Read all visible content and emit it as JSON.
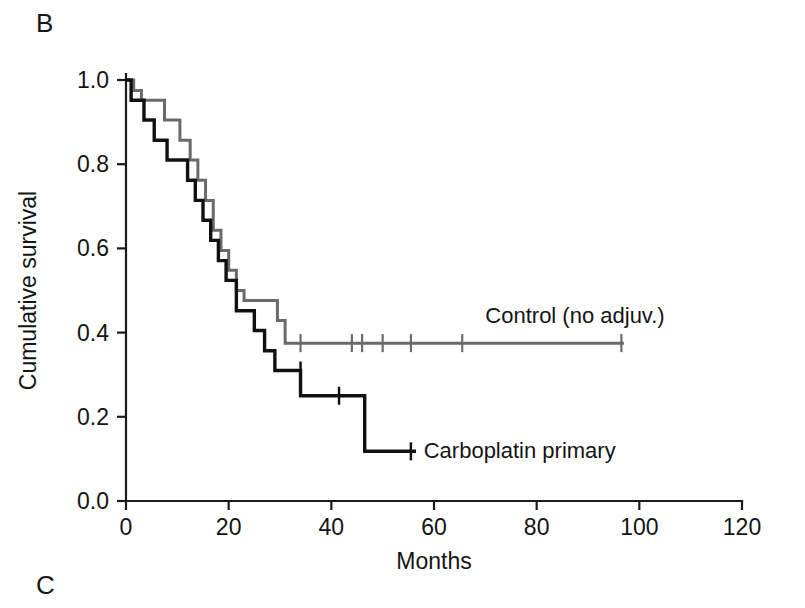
{
  "panels": {
    "current": "B",
    "next": "C"
  },
  "chart_data": {
    "type": "line",
    "subtype": "kaplan-meier-step",
    "title": "",
    "xlabel": "Months",
    "ylabel": "Cumulative survival",
    "xlim": [
      0,
      120
    ],
    "ylim": [
      0,
      1
    ],
    "xticks": [
      0,
      20,
      40,
      60,
      80,
      100,
      120
    ],
    "xticklabels": [
      "0",
      "20",
      "40",
      "60",
      "80",
      "100",
      "120"
    ],
    "yticks": [
      0.0,
      0.2,
      0.4,
      0.6,
      0.8,
      1.0
    ],
    "yticklabels": [
      "0.0",
      "0.2",
      "0.4",
      "0.6",
      "0.8",
      "1.0"
    ],
    "grid": false,
    "legend_position": "inline-annotation",
    "series": [
      {
        "name": "Control (no adjuv.)",
        "color": "#6a6a6a",
        "linewidth": 3,
        "label_x": 70,
        "label_y": 0.44,
        "steps": [
          [
            0.0,
            1.0
          ],
          [
            1.5,
            1.0
          ],
          [
            1.5,
            0.975
          ],
          [
            3.0,
            0.975
          ],
          [
            3.0,
            0.952
          ],
          [
            7.5,
            0.952
          ],
          [
            7.5,
            0.905
          ],
          [
            10.5,
            0.905
          ],
          [
            10.5,
            0.857
          ],
          [
            12.5,
            0.857
          ],
          [
            12.5,
            0.81
          ],
          [
            14.0,
            0.81
          ],
          [
            14.0,
            0.762
          ],
          [
            15.5,
            0.762
          ],
          [
            15.5,
            0.714
          ],
          [
            17.0,
            0.714
          ],
          [
            17.0,
            0.643
          ],
          [
            18.5,
            0.643
          ],
          [
            18.5,
            0.595
          ],
          [
            20.0,
            0.595
          ],
          [
            20.0,
            0.548
          ],
          [
            21.5,
            0.548
          ],
          [
            21.5,
            0.5
          ],
          [
            23.0,
            0.5
          ],
          [
            23.0,
            0.476
          ],
          [
            29.5,
            0.476
          ],
          [
            29.5,
            0.429
          ],
          [
            31.0,
            0.429
          ],
          [
            31.0,
            0.375
          ],
          [
            97.0,
            0.375
          ]
        ],
        "censor_marks": [
          [
            34.0,
            0.375
          ],
          [
            44.0,
            0.375
          ],
          [
            46.0,
            0.375
          ],
          [
            50.0,
            0.375
          ],
          [
            55.5,
            0.375
          ],
          [
            65.5,
            0.375
          ],
          [
            96.5,
            0.375
          ]
        ]
      },
      {
        "name": "Carboplatin primary",
        "color": "#111111",
        "linewidth": 3.4,
        "label_x": 58,
        "label_y": 0.118,
        "steps": [
          [
            0.0,
            1.0
          ],
          [
            1.0,
            1.0
          ],
          [
            1.0,
            0.952
          ],
          [
            3.5,
            0.952
          ],
          [
            3.5,
            0.905
          ],
          [
            5.5,
            0.905
          ],
          [
            5.5,
            0.857
          ],
          [
            8.0,
            0.857
          ],
          [
            8.0,
            0.81
          ],
          [
            12.0,
            0.81
          ],
          [
            12.0,
            0.762
          ],
          [
            13.5,
            0.762
          ],
          [
            13.5,
            0.714
          ],
          [
            15.0,
            0.714
          ],
          [
            15.0,
            0.667
          ],
          [
            16.5,
            0.667
          ],
          [
            16.5,
            0.619
          ],
          [
            18.0,
            0.619
          ],
          [
            18.0,
            0.571
          ],
          [
            19.5,
            0.571
          ],
          [
            19.5,
            0.524
          ],
          [
            21.5,
            0.524
          ],
          [
            21.5,
            0.452
          ],
          [
            25.0,
            0.452
          ],
          [
            25.0,
            0.405
          ],
          [
            27.0,
            0.405
          ],
          [
            27.0,
            0.357
          ],
          [
            29.0,
            0.357
          ],
          [
            29.0,
            0.31
          ],
          [
            34.0,
            0.31
          ],
          [
            34.0,
            0.25
          ],
          [
            46.5,
            0.25
          ],
          [
            46.5,
            0.118
          ],
          [
            56.5,
            0.118
          ]
        ],
        "censor_marks": [
          [
            34.0,
            0.31
          ],
          [
            41.5,
            0.25
          ],
          [
            55.5,
            0.118
          ]
        ]
      }
    ]
  }
}
